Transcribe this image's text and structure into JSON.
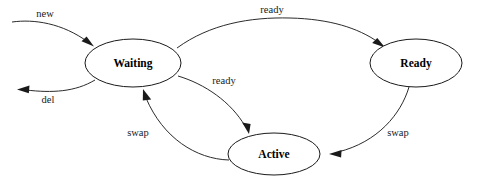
{
  "diagram": {
    "type": "state-transition-diagram",
    "background_color": "#ffffff",
    "line_color": "#2b2b2b",
    "text_color": "#000000",
    "width": 477,
    "height": 189,
    "nodes": [
      {
        "id": "waiting",
        "label": "Waiting",
        "cx": 133,
        "cy": 63,
        "rx": 48,
        "ry": 24
      },
      {
        "id": "ready",
        "label": "Ready",
        "cx": 416,
        "cy": 63,
        "rx": 46,
        "ry": 24
      },
      {
        "id": "active",
        "label": "Active",
        "cx": 274,
        "cy": 154,
        "rx": 46,
        "ry": 21
      }
    ],
    "edges": [
      {
        "id": "edge-new",
        "label": "new",
        "from": "external-entry",
        "to": "waiting",
        "label_x": 45,
        "label_y": 15
      },
      {
        "id": "edge-del",
        "label": "del",
        "from": "waiting",
        "to": "external-exit",
        "label_x": 48,
        "label_y": 101
      },
      {
        "id": "edge-ready-top",
        "label": "ready",
        "from": "waiting",
        "to": "ready",
        "label_x": 272,
        "label_y": 11
      },
      {
        "id": "edge-ready-active",
        "label": "ready",
        "from": "waiting",
        "to": "active",
        "label_x": 224,
        "label_y": 82
      },
      {
        "id": "edge-swap-left",
        "label": "swap",
        "from": "active",
        "to": "waiting",
        "label_x": 138,
        "label_y": 134
      },
      {
        "id": "edge-swap-right",
        "label": "swap",
        "from": "ready",
        "to": "active",
        "label_x": 398,
        "label_y": 134
      }
    ]
  }
}
